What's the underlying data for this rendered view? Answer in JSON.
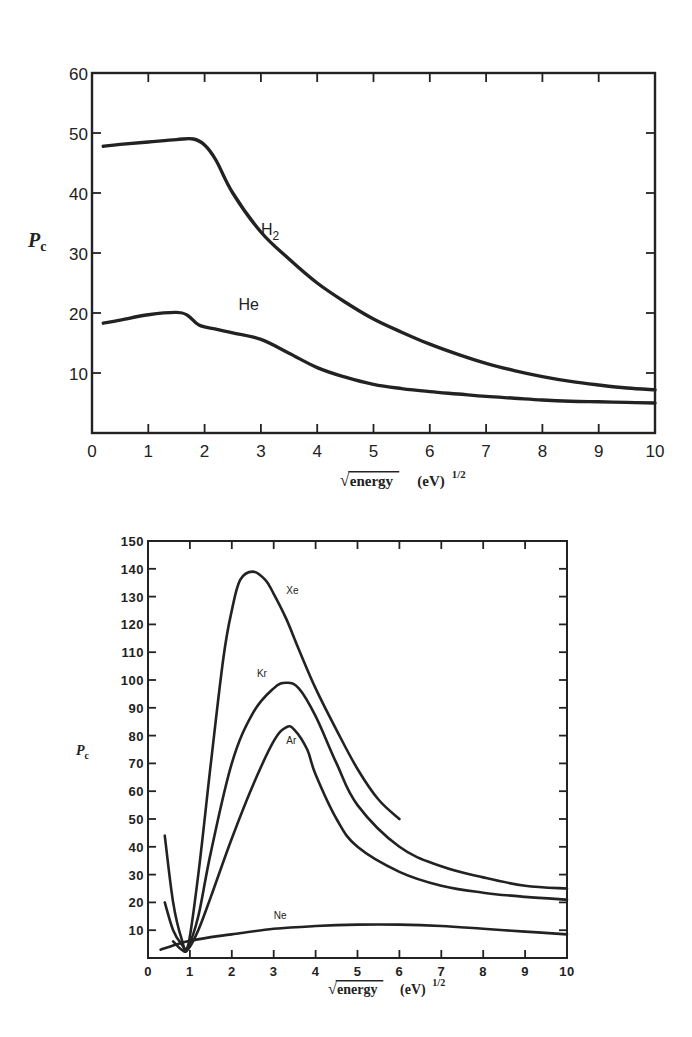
{
  "chart_data": [
    {
      "type": "line",
      "title": "",
      "xlabel": "√energy (eV)^1/2",
      "xlabel_parts": {
        "sqrt_term": "energy",
        "unit": "(eV)",
        "exponent": "1/2"
      },
      "ylabel": "Pc",
      "ylabel_parts": {
        "main": "P",
        "sub": "c"
      },
      "xlim": [
        0,
        10
      ],
      "ylim": [
        0,
        60
      ],
      "x_ticks": [
        "0",
        "1",
        "2",
        "3",
        "4",
        "5",
        "6",
        "7",
        "8",
        "9",
        "10"
      ],
      "y_ticks": [
        "10",
        "20",
        "30",
        "40",
        "50",
        "60"
      ],
      "grid": false,
      "legend": "inline labels",
      "series": [
        {
          "name": "H2",
          "label_main": "H",
          "label_sub": "2",
          "label_pos": [
            3.0,
            33
          ],
          "x": [
            0.2,
            0.5,
            1.0,
            1.5,
            1.8,
            2.0,
            2.2,
            2.5,
            3.0,
            3.5,
            4.0,
            4.5,
            5.0,
            5.5,
            6.0,
            6.5,
            7.0,
            7.5,
            8.0,
            8.5,
            9.0,
            9.5,
            10.0
          ],
          "y": [
            47.8,
            48.1,
            48.5,
            48.9,
            49.0,
            48.0,
            45.5,
            40.0,
            33.5,
            29.0,
            25.0,
            21.8,
            19.0,
            16.8,
            14.8,
            13.1,
            11.6,
            10.4,
            9.4,
            8.6,
            8.0,
            7.5,
            7.2
          ]
        },
        {
          "name": "He",
          "label_main": "He",
          "label_sub": "",
          "label_pos": [
            2.6,
            20.5
          ],
          "x": [
            0.2,
            0.5,
            1.0,
            1.5,
            1.7,
            1.9,
            2.2,
            2.5,
            3.0,
            3.5,
            4.0,
            4.5,
            5.0,
            5.5,
            6.0,
            6.5,
            7.0,
            7.5,
            8.0,
            8.5,
            9.0,
            9.5,
            10.0
          ],
          "y": [
            18.3,
            18.8,
            19.7,
            20.1,
            19.6,
            18.0,
            17.3,
            16.7,
            15.6,
            13.3,
            10.9,
            9.3,
            8.1,
            7.4,
            6.9,
            6.5,
            6.1,
            5.8,
            5.5,
            5.3,
            5.2,
            5.1,
            5.0
          ]
        }
      ]
    },
    {
      "type": "line",
      "title": "",
      "xlabel": "√energy (eV)^1/2",
      "xlabel_parts": {
        "sqrt_term": "energy",
        "unit": "(eV)",
        "exponent": "1/2"
      },
      "ylabel": "Pc",
      "ylabel_parts": {
        "main": "P",
        "sub": "c"
      },
      "xlim": [
        0,
        10
      ],
      "ylim": [
        0,
        150
      ],
      "x_ticks": [
        "0",
        "1",
        "2",
        "3",
        "4",
        "5",
        "6",
        "7",
        "8",
        "9",
        "10"
      ],
      "y_ticks": [
        "10",
        "20",
        "30",
        "40",
        "50",
        "60",
        "70",
        "80",
        "90",
        "100",
        "110",
        "120",
        "130",
        "140",
        "150"
      ],
      "grid": false,
      "legend": "inline labels",
      "series": [
        {
          "name": "Xe",
          "label_main": "Xe",
          "label_pos": [
            3.3,
            131
          ],
          "x": [
            0.4,
            0.6,
            0.8,
            0.95,
            1.2,
            1.5,
            1.8,
            2.0,
            2.2,
            2.5,
            2.8,
            3.0,
            3.3,
            3.6,
            4.0,
            4.5,
            5.0,
            5.5,
            6.0
          ],
          "y": [
            44,
            20,
            7,
            4,
            30,
            70,
            108,
            125,
            136,
            139,
            136,
            131,
            122,
            111,
            97,
            82,
            68,
            57,
            50
          ]
        },
        {
          "name": "Kr",
          "label_main": "Kr",
          "label_pos": [
            2.6,
            101
          ],
          "x": [
            0.4,
            0.6,
            0.8,
            0.95,
            1.2,
            1.5,
            2.0,
            2.5,
            3.0,
            3.3,
            3.6,
            4.0,
            4.5,
            5.0,
            6.0,
            7.0,
            8.0,
            9.0,
            10.0
          ],
          "y": [
            20,
            10,
            5,
            4,
            15,
            38,
            70,
            88,
            97,
            99,
            97,
            87,
            70,
            55,
            40,
            33,
            29,
            26,
            25
          ]
        },
        {
          "name": "Ar",
          "label_main": "Ar",
          "label_pos": [
            3.3,
            77
          ],
          "x": [
            0.6,
            0.8,
            0.95,
            1.2,
            1.5,
            2.0,
            2.5,
            3.0,
            3.3,
            3.5,
            3.8,
            4.0,
            4.5,
            5.0,
            6.0,
            7.0,
            8.0,
            9.0,
            10.0
          ],
          "y": [
            6,
            3,
            3,
            10,
            22,
            43,
            62,
            78,
            83,
            82,
            75,
            66,
            50,
            40,
            31,
            26,
            23.5,
            22,
            21
          ]
        },
        {
          "name": "Ne",
          "label_main": "Ne",
          "label_pos": [
            3.0,
            14
          ],
          "x": [
            0.3,
            0.6,
            0.95,
            1.5,
            2.0,
            3.0,
            4.0,
            5.0,
            6.0,
            7.0,
            8.0,
            9.0,
            10.0
          ],
          "y": [
            3,
            4.5,
            6,
            7.5,
            8.5,
            10.5,
            11.5,
            12,
            12,
            11.5,
            10.5,
            9.5,
            8.5
          ]
        }
      ]
    }
  ]
}
